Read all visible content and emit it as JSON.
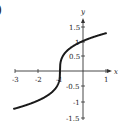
{
  "figure": {
    "part_label": ")"
  },
  "chart_data": {
    "type": "line",
    "title": "",
    "xlabel": "x",
    "ylabel": "y",
    "xlim": [
      -3,
      1
    ],
    "ylim": [
      -1.5,
      1.5
    ],
    "x_ticks": [
      "-3",
      "-2",
      "-1",
      "1"
    ],
    "y_ticks": [
      "1.5",
      "1",
      "0.5",
      "-0.5",
      "-1",
      "-1.5"
    ],
    "grid": false,
    "series": [
      {
        "name": "y = cbrt(x + 1)",
        "x": [
          -3,
          -2.5,
          -2,
          -1.5,
          -1.2,
          -1,
          -0.8,
          -0.5,
          0,
          0.5,
          1
        ],
        "y": [
          -1.26,
          -1.14,
          -1.0,
          -0.79,
          -0.58,
          0,
          0.58,
          0.79,
          1.0,
          1.14,
          1.26
        ]
      }
    ],
    "color": "#1a1a1a"
  }
}
